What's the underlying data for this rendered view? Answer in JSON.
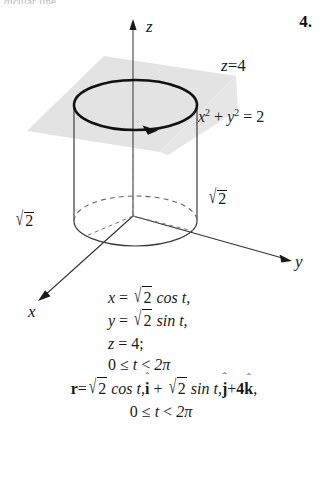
{
  "page": {
    "cutoff_text": "dicular line",
    "exercise_number": "4."
  },
  "figure": {
    "axes": {
      "z_label": "z",
      "y_label": "y",
      "x_label": "x"
    },
    "labels": {
      "plane": "z = 4",
      "cylinder_equation_lhs": "x",
      "cylinder_equation": "x² + y² = 2",
      "radius_right": "√2",
      "radius_left": "√2"
    },
    "colors": {
      "plane_fill": "#e2e2e2",
      "stroke": "#1a1a1a",
      "dashed_stroke": "#555555",
      "ink": "#111111"
    }
  },
  "equations": {
    "x_param": "x = √2 cos t,",
    "y_param": "y = √2 sin t,",
    "z_param": "z = 4;",
    "domain_1": "0 ≤ t < 2π",
    "vector": "r = √2 cos t î + √2 sin t ĵ + 4k̂,",
    "domain_2": "0 ≤ t < 2π",
    "pieces": {
      "x_lhs": "x",
      "y_lhs": "y",
      "z_lhs": "z",
      "eq": "=",
      "two": "2",
      "cos_t": "cos t,",
      "sin_t": "sin t,",
      "z_rhs": "4;",
      "zero": "0",
      "le": "≤",
      "t": "t",
      "lt": "<",
      "twopi": "2π",
      "r": "r",
      "plus": "+",
      "four": "4",
      "i": "i",
      "j": "j",
      "k": "k",
      "hat": "ˆ",
      "comma": ",",
      "radical": "√"
    }
  }
}
